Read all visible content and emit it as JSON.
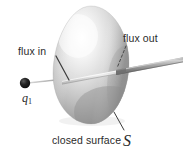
{
  "figure": {
    "labels": {
      "flux_in": "flux in",
      "flux_out": "flux out",
      "closed_surface_prefix": "closed surface",
      "closed_surface_symbol": "S",
      "charge_symbol": "q",
      "charge_subscript": "1"
    },
    "colors": {
      "background": "#ffffff",
      "text": "#2b2b2b",
      "surface_light": "#fdfdfd",
      "surface_mid": "#cfcfcf",
      "surface_dark": "#8e8e8e",
      "surface_shadow": "#7a7a7a",
      "rod_light": "#c9c9c9",
      "rod_mid": "#9a9a9a",
      "rod_dark": "#6e6e6e",
      "charge_dot": "#161616",
      "leader_line": "#3a3a3a",
      "thin_ray": "#b4b4b4"
    },
    "geometry": {
      "surface_cx": 91,
      "surface_cy": 65,
      "surface_rx": 38,
      "surface_ry": 59,
      "charge_x": 25,
      "charge_y": 83,
      "charge_r": 5,
      "rod_entry_x": 67,
      "rod_entry_y": 79,
      "rod_exit_x": 121,
      "rod_exit_y": 69,
      "rod_end_x": 180,
      "rod_end_y": 58
    }
  }
}
